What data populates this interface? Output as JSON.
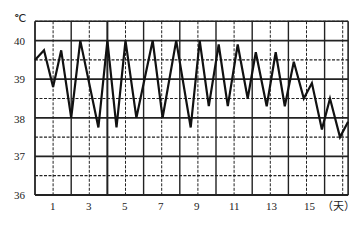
{
  "chart_data": {
    "type": "line",
    "title": "",
    "ylabel": "℃",
    "xlabel": "（天）",
    "ylim": [
      36,
      40.5
    ],
    "xlim": [
      0,
      17.3
    ],
    "grid": true,
    "y_ticks": [
      36,
      37,
      38,
      39,
      40
    ],
    "x_ticks": [
      1,
      3,
      5,
      7,
      9,
      11,
      13,
      15
    ],
    "series": [
      {
        "name": "体温",
        "points": [
          [
            0.0,
            39.5
          ],
          [
            0.5,
            39.75
          ],
          [
            1.0,
            38.8
          ],
          [
            1.45,
            39.75
          ],
          [
            2.0,
            38.0
          ],
          [
            2.5,
            40.0
          ],
          [
            3.5,
            37.75
          ],
          [
            4.0,
            40.0
          ],
          [
            4.5,
            37.75
          ],
          [
            5.0,
            40.0
          ],
          [
            5.6,
            38.0
          ],
          [
            6.5,
            40.0
          ],
          [
            7.05,
            38.0
          ],
          [
            7.8,
            40.0
          ],
          [
            8.6,
            37.75
          ],
          [
            9.1,
            40.0
          ],
          [
            9.6,
            38.3
          ],
          [
            10.15,
            39.9
          ],
          [
            10.65,
            38.3
          ],
          [
            11.2,
            39.9
          ],
          [
            11.75,
            38.5
          ],
          [
            12.2,
            39.7
          ],
          [
            12.8,
            38.3
          ],
          [
            13.3,
            39.7
          ],
          [
            13.8,
            38.3
          ],
          [
            14.3,
            39.45
          ],
          [
            14.85,
            38.5
          ],
          [
            15.3,
            38.9
          ],
          [
            15.85,
            37.7
          ],
          [
            16.3,
            38.5
          ],
          [
            16.85,
            37.5
          ],
          [
            17.3,
            37.9
          ]
        ]
      }
    ]
  },
  "labels": {
    "unit": "℃",
    "x_unit": "（天）",
    "y": [
      "40",
      "39",
      "38",
      "37",
      "36"
    ],
    "x": [
      "1",
      "3",
      "5",
      "7",
      "9",
      "11",
      "13",
      "15"
    ]
  }
}
